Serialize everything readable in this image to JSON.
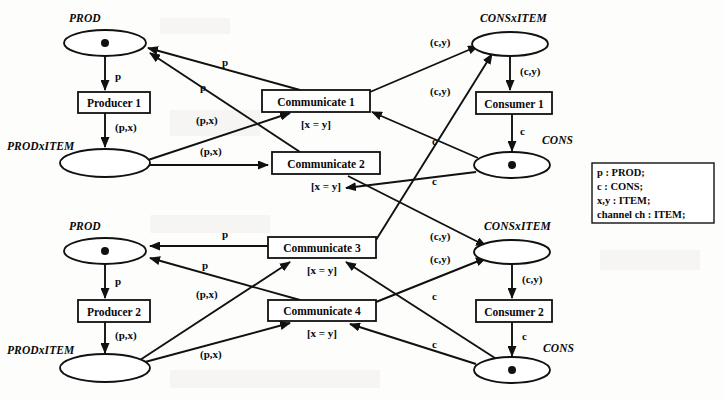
{
  "figure": {
    "title_fragment": "",
    "type": "coloured-petri-net"
  },
  "colors": {
    "ink": "#111111",
    "paper": "#fdfdfc",
    "token": "#111111"
  },
  "places": [
    {
      "id": "prod1",
      "label": "PROD",
      "cx": 105,
      "cy": 43,
      "rx": 41,
      "ry": 13,
      "tokens": 1
    },
    {
      "id": "proditem1",
      "label": "PRODxITEM",
      "cx": 105,
      "cy": 163,
      "rx": 45,
      "ry": 14,
      "tokens": 0
    },
    {
      "id": "consitem1",
      "label": "CONSxITEM",
      "cx": 510,
      "cy": 44,
      "rx": 38,
      "ry": 12,
      "tokens": 0
    },
    {
      "id": "cons1",
      "label": "CONS",
      "cx": 512,
      "cy": 165,
      "rx": 38,
      "ry": 13,
      "tokens": 1
    },
    {
      "id": "prod2",
      "label": "PROD",
      "cx": 105,
      "cy": 251,
      "rx": 41,
      "ry": 13,
      "tokens": 1
    },
    {
      "id": "proditem2",
      "label": "PRODxITEM",
      "cx": 105,
      "cy": 368,
      "rx": 45,
      "ry": 14,
      "tokens": 0
    },
    {
      "id": "consitem2",
      "label": "CONSxITEM",
      "cx": 512,
      "cy": 252,
      "rx": 38,
      "ry": 12,
      "tokens": 0
    },
    {
      "id": "cons2",
      "label": "CONS",
      "cx": 512,
      "cy": 370,
      "rx": 38,
      "ry": 13,
      "tokens": 1
    }
  ],
  "transitions": [
    {
      "id": "producer1",
      "label": "Producer 1",
      "guard": "",
      "x": 78,
      "y": 92,
      "w": 72,
      "h": 21
    },
    {
      "id": "consumer1",
      "label": "Consumer 1",
      "guard": "",
      "x": 476,
      "y": 92,
      "w": 76,
      "h": 22
    },
    {
      "id": "producer2",
      "label": "Producer 2",
      "guard": "",
      "x": 78,
      "y": 300,
      "w": 72,
      "h": 22
    },
    {
      "id": "consumer2",
      "label": "Consumer 2",
      "guard": "",
      "x": 476,
      "y": 300,
      "w": 76,
      "h": 22
    },
    {
      "id": "communicate1",
      "label": "Communicate 1",
      "guard": "[x = y]",
      "x": 262,
      "y": 90,
      "w": 108,
      "h": 22
    },
    {
      "id": "communicate2",
      "label": "Communicate 2",
      "guard": "[x = y]",
      "x": 272,
      "y": 152,
      "w": 108,
      "h": 22
    },
    {
      "id": "communicate3",
      "label": "Communicate 3",
      "guard": "[x = y]",
      "x": 268,
      "y": 237,
      "w": 108,
      "h": 21
    },
    {
      "id": "communicate4",
      "label": "Communicate 4",
      "guard": "[x = y]",
      "x": 268,
      "y": 300,
      "w": 108,
      "h": 21
    }
  ],
  "arc_labels": [
    {
      "id": "a-prod1-producer1",
      "text": "p",
      "x": 115,
      "y": 80
    },
    {
      "id": "a-producer1-pi1",
      "text": "(p,x)",
      "x": 115,
      "y": 131
    },
    {
      "id": "a-comm1-prod1",
      "text": "p",
      "x": 222,
      "y": 66
    },
    {
      "id": "a-comm2-prod1",
      "text": "p",
      "x": 200,
      "y": 91
    },
    {
      "id": "a-pi1-comm1",
      "text": "(p,x)",
      "x": 196,
      "y": 124
    },
    {
      "id": "a-pi1-comm2",
      "text": "(p,x)",
      "x": 200,
      "y": 155
    },
    {
      "id": "a-comm1-ci1",
      "text": "(c,y)",
      "x": 430,
      "y": 46
    },
    {
      "id": "a-comm3-ci1",
      "text": "(c,y)",
      "x": 430,
      "y": 95
    },
    {
      "id": "a-ci1-consumer1",
      "text": "(c,y)",
      "x": 520,
      "y": 75
    },
    {
      "id": "a-consumer1-cons1",
      "text": "c",
      "x": 520,
      "y": 135
    },
    {
      "id": "a-cons1-comm1",
      "text": "c",
      "x": 432,
      "y": 145
    },
    {
      "id": "a-cons1-comm2",
      "text": "c",
      "x": 432,
      "y": 185
    },
    {
      "id": "a-prod2-producer2",
      "text": "p",
      "x": 115,
      "y": 285
    },
    {
      "id": "a-producer2-pi2",
      "text": "(p,x)",
      "x": 115,
      "y": 339
    },
    {
      "id": "a-comm3-prod2",
      "text": "p",
      "x": 222,
      "y": 238
    },
    {
      "id": "a-comm4-prod2",
      "text": "p",
      "x": 202,
      "y": 269
    },
    {
      "id": "a-pi2-comm3",
      "text": "(p,x)",
      "x": 196,
      "y": 298
    },
    {
      "id": "a-pi2-comm4",
      "text": "(p,x)",
      "x": 200,
      "y": 358
    },
    {
      "id": "a-comm2-ci2",
      "text": "(c,y)",
      "x": 430,
      "y": 240
    },
    {
      "id": "a-comm4-ci2",
      "text": "(c,y)",
      "x": 430,
      "y": 263
    },
    {
      "id": "a-ci2-consumer2",
      "text": "(c,y)",
      "x": 522,
      "y": 283
    },
    {
      "id": "a-consumer2-cons2",
      "text": "c",
      "x": 522,
      "y": 340
    },
    {
      "id": "a-cons2-comm3",
      "text": "c",
      "x": 432,
      "y": 300
    },
    {
      "id": "a-cons2-comm4",
      "text": "c",
      "x": 432,
      "y": 348
    }
  ],
  "legend": {
    "x": 592,
    "y": 163,
    "w": 122,
    "h": 60,
    "lines": [
      "p : PROD;",
      "c : CONS;",
      "x,y : ITEM;",
      "channel ch : ITEM;"
    ]
  }
}
